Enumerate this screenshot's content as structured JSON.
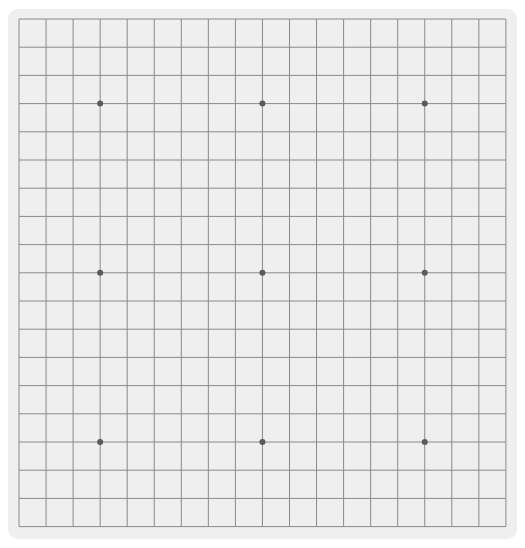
{
  "game": {
    "type": "go",
    "board_size": 19,
    "stones": [],
    "star_points": [
      [
        3,
        3
      ],
      [
        3,
        9
      ],
      [
        3,
        15
      ],
      [
        9,
        3
      ],
      [
        9,
        9
      ],
      [
        9,
        15
      ],
      [
        15,
        3
      ],
      [
        15,
        9
      ],
      [
        15,
        15
      ]
    ]
  },
  "colors": {
    "board": "#efefef",
    "grid_line": "#8a8a8a",
    "star_point": "#5a5a5a"
  },
  "layout": {
    "origin_x": 11,
    "origin_y": 10,
    "step_x": 27.05,
    "step_y": 28.2
  }
}
